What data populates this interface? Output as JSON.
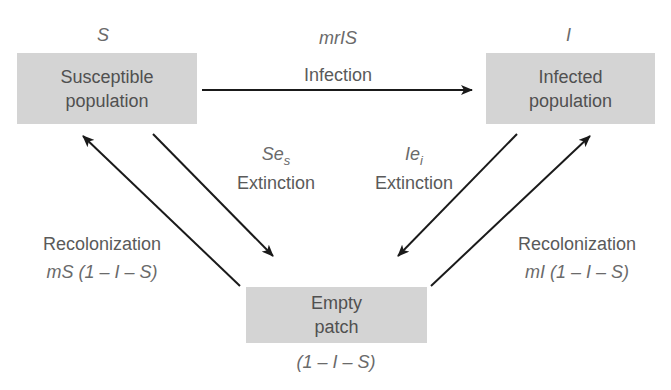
{
  "diagram": {
    "type": "metapopulation-disease-model",
    "colors": {
      "box_fill": "#d4d4d4",
      "arrow": "#1a1a1a",
      "text": "#555555"
    },
    "nodes": {
      "susceptible": {
        "symbol": "S",
        "line1": "Susceptible",
        "line2": "population"
      },
      "infected": {
        "symbol": "I",
        "line1": "Infected",
        "line2": "population"
      },
      "empty": {
        "line1": "Empty",
        "line2": "patch",
        "expression": "(1 – I – S)"
      }
    },
    "edges": {
      "infection": {
        "rate": "mrIS",
        "label": "Infection",
        "from": "susceptible",
        "to": "infected"
      },
      "extinction_s": {
        "rate_base": "Se",
        "rate_sub": "s",
        "label": "Extinction",
        "from": "susceptible",
        "to": "empty"
      },
      "extinction_i": {
        "rate_base": "Ie",
        "rate_sub": "i",
        "label": "Extinction",
        "from": "infected",
        "to": "empty"
      },
      "recolonization_s": {
        "label": "Recolonization",
        "rate": "mS (1 – I – S)",
        "from": "empty",
        "to": "susceptible"
      },
      "recolonization_i": {
        "label": "Recolonization",
        "rate": "mI (1 – I – S)",
        "from": "empty",
        "to": "infected"
      }
    }
  }
}
